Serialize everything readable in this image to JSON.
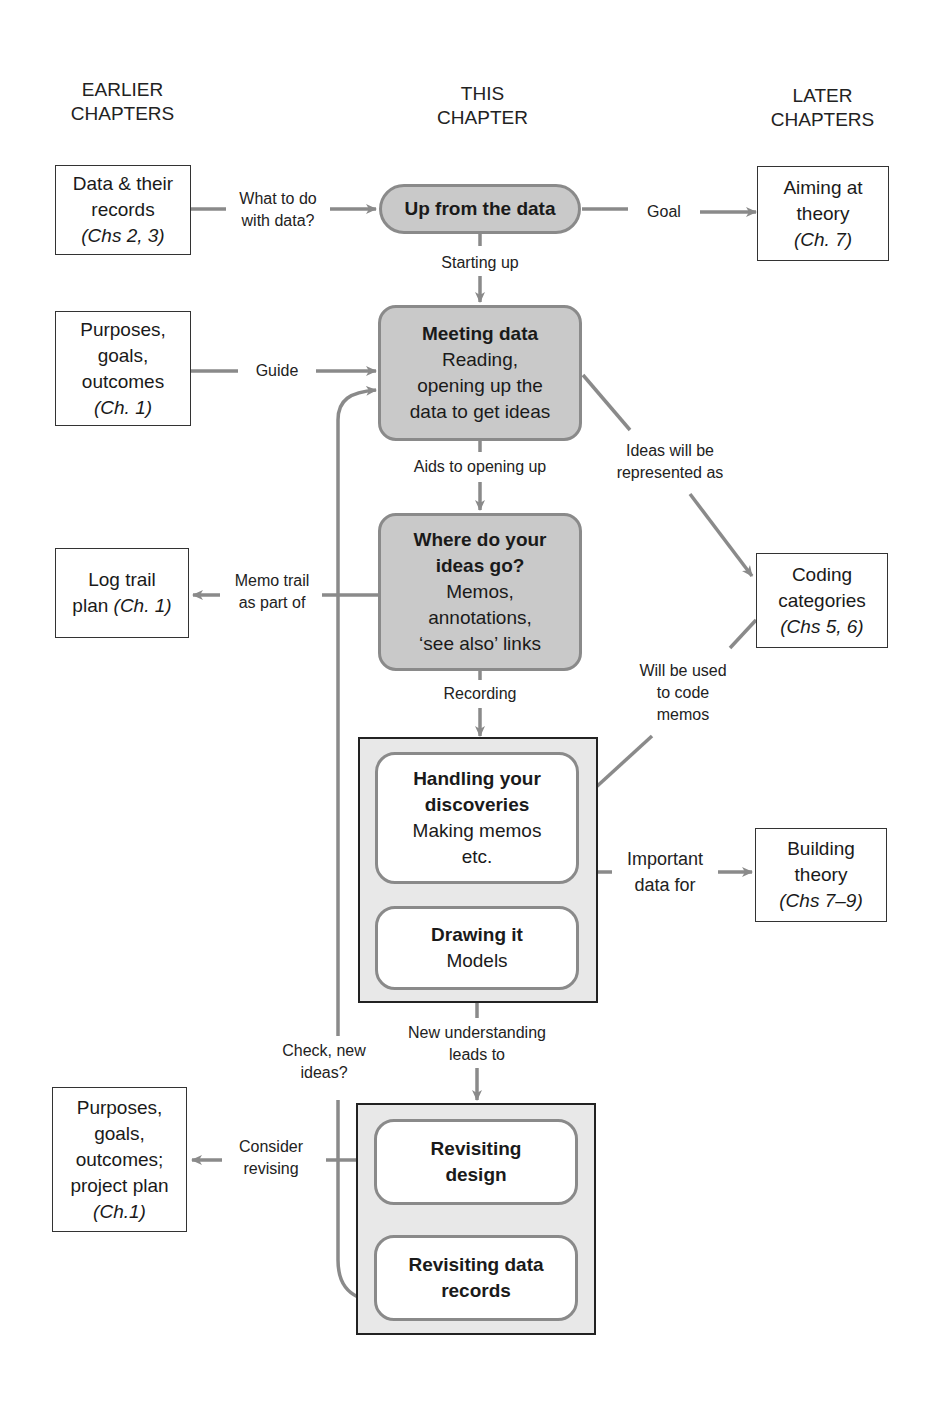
{
  "headers": {
    "earlier": [
      "EARLIER",
      "CHAPTERS"
    ],
    "this": [
      "THIS",
      "CHAPTER"
    ],
    "later": [
      "LATER",
      "CHAPTERS"
    ]
  },
  "external_boxes": {
    "data_records": {
      "lines": [
        "Data & their",
        "records"
      ],
      "chapter": "(Chs 2, 3)"
    },
    "purposes_top": {
      "lines": [
        "Purposes,",
        "goals,",
        "outcomes"
      ],
      "chapter": "(Ch. 1)"
    },
    "log_trail": {
      "lines": [
        "Log trail"
      ],
      "line2_prefix": "plan ",
      "chapter": "(Ch. 1)"
    },
    "purposes_bottom": {
      "lines": [
        "Purposes,",
        "goals,",
        "outcomes;",
        "project plan"
      ],
      "chapter": "(Ch.1)"
    },
    "aiming_theory": {
      "lines": [
        "Aiming at",
        "theory"
      ],
      "chapter": "(Ch. 7)"
    },
    "coding_categories": {
      "lines": [
        "Coding",
        "categories"
      ],
      "chapter": "(Chs 5, 6)"
    },
    "building_theory": {
      "lines": [
        "Building",
        "theory"
      ],
      "chapter": "(Chs 7–9)"
    }
  },
  "process_boxes": {
    "up_from_data": {
      "title": "Up from the data"
    },
    "meeting_data": {
      "title": "Meeting data",
      "lines": [
        "Reading,",
        "opening up the",
        "data to get ideas"
      ]
    },
    "where_ideas_go": {
      "title_lines": [
        "Where do your",
        "ideas go?"
      ],
      "lines": [
        "Memos,",
        "annotations,",
        "‘see also’ links"
      ]
    },
    "handling": {
      "title_lines": [
        "Handling your",
        "discoveries"
      ],
      "lines": [
        "Making memos",
        "etc."
      ]
    },
    "drawing": {
      "title": "Drawing it",
      "lines": [
        "Models"
      ]
    },
    "revisit_design": {
      "title_lines": [
        "Revisiting",
        "design"
      ]
    },
    "revisit_records": {
      "title_lines": [
        "Revisiting data",
        "records"
      ]
    }
  },
  "edge_labels": {
    "what_to_do": [
      "What to do",
      "with data?"
    ],
    "goal": "Goal",
    "starting_up": "Starting up",
    "guide": "Guide",
    "aids": "Aids to opening up",
    "ideas_represented": [
      "Ideas will be",
      "represented as"
    ],
    "memo_trail": [
      "Memo trail",
      "as part of"
    ],
    "recording": "Recording",
    "will_be_used": [
      "Will be used",
      "to code",
      "memos"
    ],
    "important_data": [
      "Important",
      "data for"
    ],
    "new_understanding": [
      "New understanding",
      "leads to"
    ],
    "check_new_ideas": [
      "Check, new",
      "ideas?"
    ],
    "consider_revising": [
      "Consider",
      "revising"
    ]
  },
  "colors": {
    "connector": "#8a8a8a",
    "process_fill": "#c9c9c9",
    "frame_fill": "#e8e8e8",
    "border_dark": "#222222"
  }
}
